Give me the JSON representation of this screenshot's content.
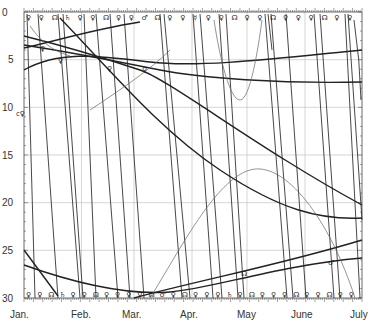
{
  "chart_data": {
    "type": "line",
    "title": "",
    "xlabel": "",
    "ylabel": "",
    "x_tick_labels": [
      "Jan.",
      "Feb.",
      "Mar.",
      "Apr.",
      "May",
      "June",
      "July"
    ],
    "y_tick_labels": [
      "0",
      "5",
      "10",
      "15",
      "20",
      "25",
      "30"
    ],
    "ylim": [
      0,
      30
    ],
    "y_inverted": true,
    "grid": true,
    "annotations": [
      "☊",
      "♂",
      "♀",
      "☿",
      "c♀"
    ],
    "series": [
      {
        "name": "steep line 1",
        "points": [
          [
            0.05,
            0
          ],
          [
            0.6,
            30
          ]
        ]
      },
      {
        "name": "steep line 2",
        "points": [
          [
            0.35,
            0
          ],
          [
            0.9,
            30
          ]
        ]
      },
      {
        "name": "steep line 3",
        "points": [
          [
            0.85,
            0
          ],
          [
            1.4,
            30
          ]
        ]
      },
      {
        "name": "steep line 4",
        "points": [
          [
            1.15,
            0
          ],
          [
            1.7,
            30
          ]
        ]
      },
      {
        "name": "steep line 5",
        "points": [
          [
            1.45,
            0
          ],
          [
            2.0,
            30
          ]
        ]
      },
      {
        "name": "steep line 6",
        "points": [
          [
            1.7,
            0
          ],
          [
            2.25,
            30
          ]
        ]
      },
      {
        "name": "steep line 7",
        "points": [
          [
            1.95,
            0
          ],
          [
            2.5,
            30
          ]
        ]
      },
      {
        "name": "steep line 8",
        "points": [
          [
            2.5,
            0
          ],
          [
            3.05,
            30
          ]
        ]
      },
      {
        "name": "steep line 9",
        "points": [
          [
            2.75,
            0
          ],
          [
            3.25,
            30
          ]
        ]
      },
      {
        "name": "steep line 10",
        "points": [
          [
            3.3,
            0
          ],
          [
            3.85,
            30
          ]
        ]
      },
      {
        "name": "steep line 11",
        "points": [
          [
            3.55,
            0
          ],
          [
            4.1,
            30
          ]
        ]
      },
      {
        "name": "steep line 12",
        "points": [
          [
            4.15,
            0
          ],
          [
            4.7,
            30
          ]
        ]
      },
      {
        "name": "steep line 13",
        "points": [
          [
            4.4,
            0
          ],
          [
            4.95,
            30
          ]
        ]
      },
      {
        "name": "steep line 14",
        "points": [
          [
            5.0,
            0
          ],
          [
            5.55,
            30
          ]
        ]
      },
      {
        "name": "steep line 15",
        "points": [
          [
            5.25,
            0
          ],
          [
            5.8,
            30
          ]
        ]
      },
      {
        "name": "steep line 16",
        "points": [
          [
            5.85,
            0
          ],
          [
            6.0,
            22
          ]
        ]
      },
      {
        "name": "curve A",
        "points": [
          [
            0,
            2.5
          ],
          [
            2,
            6
          ],
          [
            4,
            13
          ],
          [
            6,
            20.5
          ]
        ]
      },
      {
        "name": "curve B",
        "points": [
          [
            0,
            3.5
          ],
          [
            1,
            5
          ],
          [
            2,
            6
          ],
          [
            3,
            7.5
          ],
          [
            4,
            8.5
          ],
          [
            6,
            8.5
          ]
        ]
      },
      {
        "name": "curve C",
        "points": [
          [
            0,
            6
          ],
          [
            1,
            4
          ],
          [
            2,
            5
          ],
          [
            3,
            5.5
          ],
          [
            4,
            5
          ],
          [
            6,
            4
          ]
        ]
      },
      {
        "name": "curve D",
        "points": [
          [
            0.8,
            0.5
          ],
          [
            2,
            7
          ],
          [
            3.5,
            15
          ],
          [
            5,
            21
          ],
          [
            6,
            21.5
          ]
        ]
      },
      {
        "name": "curve E",
        "points": [
          [
            0,
            27
          ],
          [
            2,
            29.5
          ],
          [
            3,
            29
          ],
          [
            4,
            27.5
          ],
          [
            5,
            26.5
          ],
          [
            6,
            26
          ]
        ]
      },
      {
        "name": "curve F",
        "points": [
          [
            0,
            25
          ],
          [
            1,
            30
          ]
        ]
      },
      {
        "name": "curve G",
        "points": [
          [
            2,
            30
          ],
          [
            3,
            28.5
          ],
          [
            4,
            27
          ],
          [
            5,
            25.5
          ],
          [
            6,
            24
          ]
        ]
      },
      {
        "name": "parabola",
        "points": [
          [
            3.4,
            3
          ],
          [
            3.7,
            9.5
          ],
          [
            4.0,
            3
          ]
        ]
      },
      {
        "name": "thin arc",
        "points": [
          [
            2.6,
            30
          ],
          [
            3.5,
            20
          ],
          [
            4.2,
            17
          ],
          [
            5,
            21
          ],
          [
            5.9,
            30
          ]
        ]
      }
    ]
  },
  "axis": {
    "y_labels": [
      "0",
      "5",
      "10",
      "15",
      "20",
      "25",
      "30"
    ],
    "x_labels": [
      "Jan.",
      "Feb.",
      "Mar.",
      "Apr.",
      "May",
      "June",
      "July"
    ],
    "side_marker": "c♀"
  },
  "symbols": {
    "top": [
      "♀",
      "♀",
      "☊",
      "♄",
      "♀",
      "♀",
      "☊",
      "♀",
      "♀",
      "♂",
      "☊",
      "♀",
      "♀",
      "☿",
      "♀",
      "♀",
      "☊",
      "♀",
      "♀",
      "☊",
      "♀",
      "♀",
      "♀",
      "☊",
      "♀",
      "♀"
    ],
    "bottom": [
      "♀",
      "♀",
      "☊",
      "♄",
      "♀",
      "♀",
      "☊",
      "♀",
      "♀",
      "♀",
      "♀",
      "☊",
      "♂",
      "♀",
      "☊",
      "♀",
      "♀",
      "♀",
      "♄",
      "♀",
      "☊",
      "♀",
      "♀",
      "♀",
      "☊",
      "♀",
      "♀",
      "☊",
      "♀",
      "♀"
    ],
    "inner": [
      "♀",
      "♀",
      "♀",
      "♀",
      "☊",
      "♂"
    ]
  }
}
